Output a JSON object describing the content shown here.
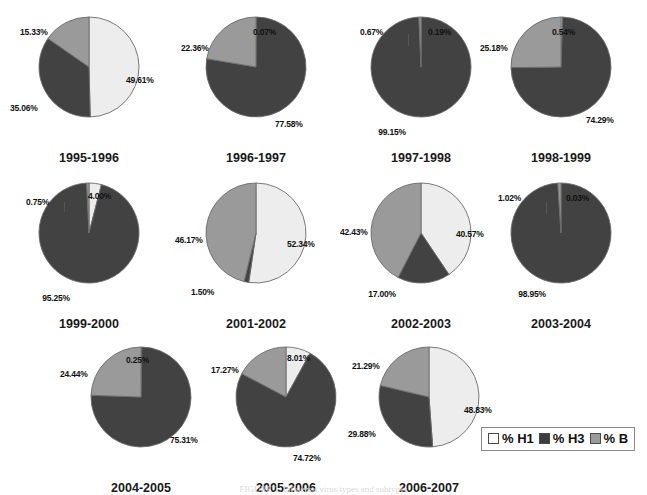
{
  "figure": {
    "background": "#ffffff",
    "caption": "FIGURE 1. Influenza virus types and subtypes"
  },
  "colors": {
    "h1": "#ededed",
    "h3": "#424242",
    "b": "#9a9a9a",
    "outline": "#6b6b6b",
    "label": "#111111"
  },
  "legend": {
    "items": [
      {
        "label": "% H1",
        "color_key": "h1",
        "swatch": "#ffffff"
      },
      {
        "label": "% H3",
        "color_key": "h3",
        "swatch": "#3d3d3d"
      },
      {
        "label": "% B",
        "color_key": "b",
        "swatch": "#9a9a9a"
      }
    ]
  },
  "chart_data": {
    "type": "pie",
    "title": "",
    "legend": [
      "% H1",
      "% H3",
      "% B"
    ],
    "legend_position": "bottom-right",
    "series_names": [
      "% H1",
      "% H3",
      "% B"
    ],
    "units": "percent",
    "charts": [
      {
        "title": "1995-1996",
        "labels": [
          "% H1",
          "% H3",
          "% B"
        ],
        "values": [
          49.61,
          35.06,
          15.33
        ],
        "value_labels": [
          "49.61%",
          "35.06%",
          "15.33%"
        ]
      },
      {
        "title": "1996-1997",
        "labels": [
          "% H1",
          "% H3",
          "% B"
        ],
        "values": [
          0.07,
          77.58,
          22.36
        ],
        "value_labels": [
          "0.07%",
          "77.58%",
          "22.36%"
        ]
      },
      {
        "title": "1997-1998",
        "labels": [
          "% H1",
          "% H3",
          "% B"
        ],
        "values": [
          0.19,
          99.15,
          0.67
        ],
        "value_labels": [
          "0.19%",
          "99.15%",
          "0.67%"
        ]
      },
      {
        "title": "1998-1999",
        "labels": [
          "% H1",
          "% H3",
          "% B"
        ],
        "values": [
          0.54,
          74.29,
          25.18
        ],
        "value_labels": [
          "0.54%",
          "74.29%",
          "25.18%"
        ]
      },
      {
        "title": "1999-2000",
        "labels": [
          "% H1",
          "% H3",
          "% B"
        ],
        "values": [
          4.0,
          95.25,
          0.75
        ],
        "value_labels": [
          "4.00%",
          "95.25%",
          "0.75%"
        ]
      },
      {
        "title": "2001-2002",
        "labels": [
          "% H1",
          "% H3",
          "% B"
        ],
        "values": [
          52.34,
          1.5,
          46.17
        ],
        "value_labels": [
          "52.34%",
          "1.50%",
          "46.17%"
        ]
      },
      {
        "title": "2002-2003",
        "labels": [
          "% H1",
          "% H3",
          "% B"
        ],
        "values": [
          40.57,
          17.0,
          42.43
        ],
        "value_labels": [
          "40.57%",
          "17.00%",
          "42.43%"
        ]
      },
      {
        "title": "2003-2004",
        "labels": [
          "% H1",
          "% H3",
          "% B"
        ],
        "values": [
          0.03,
          98.95,
          1.02
        ],
        "value_labels": [
          "0.03%",
          "98.95%",
          "1.02%"
        ]
      },
      {
        "title": "2004-2005",
        "labels": [
          "% H1",
          "% H3",
          "% B"
        ],
        "values": [
          0.25,
          75.31,
          24.44
        ],
        "value_labels": [
          "0.25%",
          "75.31%",
          "24.44%"
        ]
      },
      {
        "title": "2005-2006",
        "labels": [
          "% H1",
          "% H3",
          "% B"
        ],
        "values": [
          8.01,
          74.72,
          17.27
        ],
        "value_labels": [
          "8.01%",
          "74.72%",
          "17.27%"
        ]
      },
      {
        "title": "2006-2007",
        "labels": [
          "% H1",
          "% H3",
          "% B"
        ],
        "values": [
          48.83,
          29.88,
          21.29
        ],
        "value_labels": [
          "48.83%",
          "29.88%",
          "21.29%"
        ]
      }
    ]
  },
  "layout": {
    "cells": [
      {
        "left": 8,
        "top": 6,
        "radius": 50
      },
      {
        "left": 175,
        "top": 6,
        "radius": 50
      },
      {
        "left": 340,
        "top": 6,
        "radius": 50
      },
      {
        "left": 480,
        "top": 6,
        "radius": 50
      },
      {
        "left": 8,
        "top": 172,
        "radius": 50
      },
      {
        "left": 175,
        "top": 172,
        "radius": 50
      },
      {
        "left": 340,
        "top": 172,
        "radius": 50
      },
      {
        "left": 480,
        "top": 172,
        "radius": 50
      },
      {
        "left": 60,
        "top": 336,
        "radius": 50
      },
      {
        "left": 205,
        "top": 336,
        "radius": 50
      },
      {
        "left": 348,
        "top": 336,
        "radius": 50
      }
    ],
    "label_offsets": [
      [
        {
          "x": 118,
          "y": 70,
          "a": "l"
        },
        {
          "x": 2,
          "y": 98,
          "a": "l"
        },
        {
          "x": 12,
          "y": 22,
          "a": "l"
        }
      ],
      [
        {
          "x": 78,
          "y": 22,
          "a": "l"
        },
        {
          "x": 100,
          "y": 114,
          "a": "l"
        },
        {
          "x": 6,
          "y": 38,
          "a": "l"
        }
      ],
      [
        {
          "x": 88,
          "y": 22,
          "a": "l"
        },
        {
          "x": 52,
          "y": 122,
          "a": "c"
        },
        {
          "x": 20,
          "y": 22,
          "a": "l"
        }
      ],
      [
        {
          "x": 72,
          "y": 22,
          "a": "l"
        },
        {
          "x": 106,
          "y": 110,
          "a": "l"
        },
        {
          "x": 0,
          "y": 38,
          "a": "l"
        }
      ],
      [
        {
          "x": 80,
          "y": 20,
          "a": "l"
        },
        {
          "x": 48,
          "y": 122,
          "a": "c"
        },
        {
          "x": 18,
          "y": 26,
          "a": "l"
        }
      ],
      [
        {
          "x": 112,
          "y": 68,
          "a": "l"
        },
        {
          "x": 16,
          "y": 116,
          "a": "l"
        },
        {
          "x": 0,
          "y": 64,
          "a": "l"
        }
      ],
      [
        {
          "x": 116,
          "y": 58,
          "a": "l"
        },
        {
          "x": 42,
          "y": 118,
          "a": "c"
        },
        {
          "x": 0,
          "y": 56,
          "a": "l"
        }
      ],
      [
        {
          "x": 86,
          "y": 22,
          "a": "l"
        },
        {
          "x": 52,
          "y": 118,
          "a": "c"
        },
        {
          "x": 18,
          "y": 22,
          "a": "l"
        }
      ],
      [
        {
          "x": 66,
          "y": 20,
          "a": "l"
        },
        {
          "x": 110,
          "y": 100,
          "a": "l"
        },
        {
          "x": 0,
          "y": 34,
          "a": "l"
        }
      ],
      [
        {
          "x": 82,
          "y": 18,
          "a": "l"
        },
        {
          "x": 88,
          "y": 118,
          "a": "l"
        },
        {
          "x": 6,
          "y": 30,
          "a": "l"
        }
      ],
      [
        {
          "x": 116,
          "y": 70,
          "a": "l"
        },
        {
          "x": 0,
          "y": 94,
          "a": "l"
        },
        {
          "x": 4,
          "y": 26,
          "a": "l"
        }
      ]
    ]
  }
}
